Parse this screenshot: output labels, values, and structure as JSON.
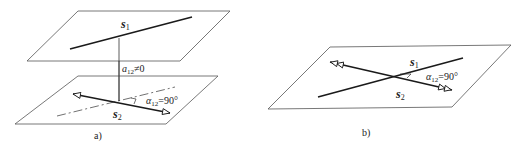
{
  "figure": {
    "panels": [
      {
        "id": "a",
        "caption": "a)",
        "labels": {
          "s1": "s",
          "s1_sub": "1",
          "s2": "s",
          "s2_sub": "2",
          "distance": "a",
          "distance_sub": "12",
          "distance_rel": "≠0",
          "angle": "α",
          "angle_sub": "12",
          "angle_rel": "=90°"
        },
        "description": "Two parallel planes; line s1 on upper plane, arrow s2 on lower plane, common perpendicular of length a12≠0, projected angle α12=90°"
      },
      {
        "id": "b",
        "caption": "b)",
        "labels": {
          "s1": "s",
          "s1_sub": "1",
          "s2": "s",
          "s2_sub": "2",
          "angle": "α",
          "angle_sub": "12",
          "angle_rel": "=90°"
        },
        "description": "Single plane with intersecting lines s1 and s2 (double arrowheads), angle α12=90°"
      }
    ],
    "colors": {
      "line": "#1a1a1a",
      "plane_edge": "#555555",
      "background": "#ffffff"
    }
  }
}
